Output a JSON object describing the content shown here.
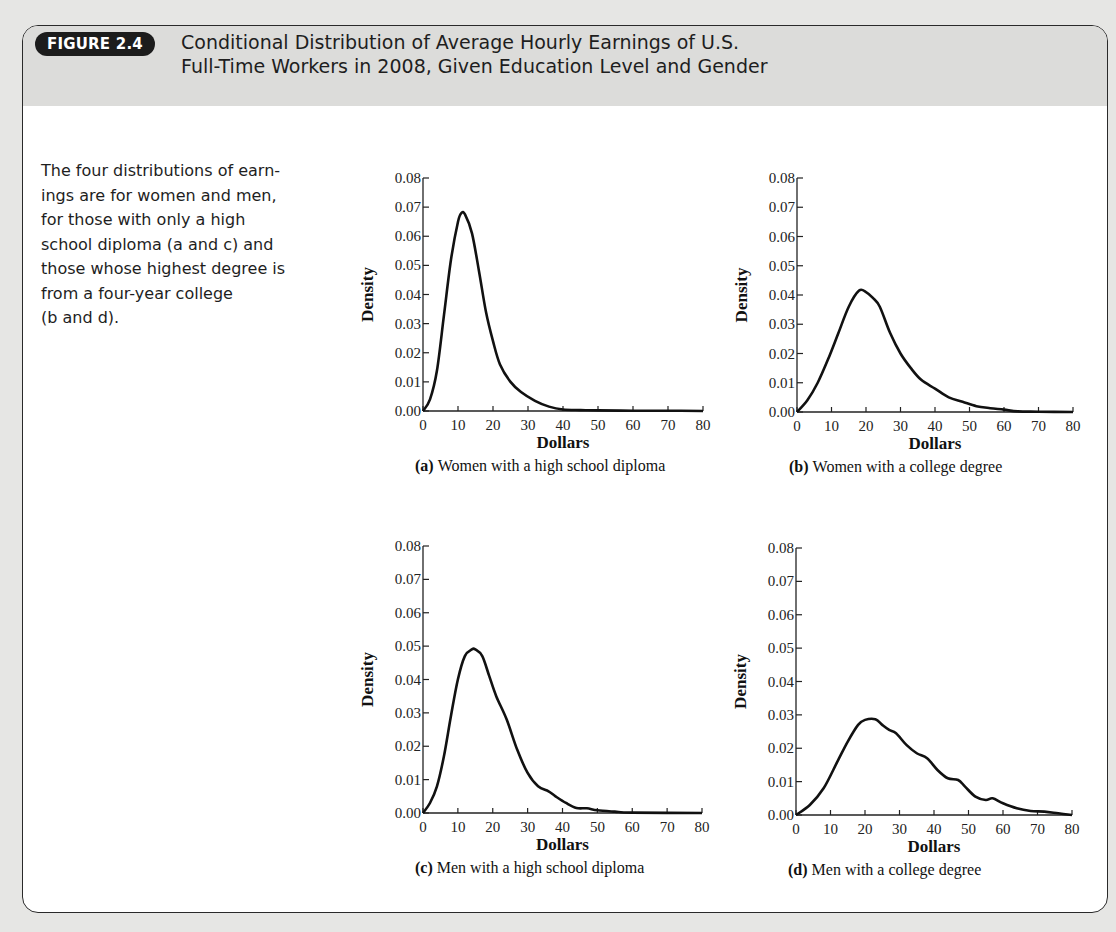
{
  "figure": {
    "badge": "FIGURE 2.4",
    "title_line1": "Conditional Distribution of Average Hourly Earnings of U.S.",
    "title_line2": "Full-Time Workers in 2008, Given Education Level and Gender",
    "description_lines": [
      "The four distributions of earn-",
      "ings are for women and men,",
      "for those with only a high",
      "school diploma (a and c) and",
      "those whose highest degree is",
      "from a four-year college",
      "(b and d)."
    ]
  },
  "chart_data": [
    {
      "type": "line",
      "panel": "a",
      "caption_letter": "(a)",
      "caption": "Women with a high school diploma",
      "title": "",
      "xlabel": "Dollars",
      "ylabel": "Density",
      "xlim": [
        0,
        80
      ],
      "ylim": [
        0,
        0.08
      ],
      "xticks": [
        "0",
        "10",
        "20",
        "30",
        "40",
        "50",
        "60",
        "70",
        "80"
      ],
      "yticks": [
        "0.00",
        "0.01",
        "0.02",
        "0.03",
        "0.04",
        "0.05",
        "0.06",
        "0.07",
        "0.08"
      ],
      "grid": false,
      "x": [
        0,
        2,
        4,
        6,
        8,
        10,
        11,
        12,
        14,
        16,
        18,
        20,
        22,
        25,
        28,
        32,
        36,
        40,
        45,
        50,
        60,
        70,
        80
      ],
      "y": [
        0.0,
        0.004,
        0.014,
        0.033,
        0.052,
        0.065,
        0.068,
        0.0675,
        0.061,
        0.048,
        0.034,
        0.024,
        0.016,
        0.01,
        0.0065,
        0.0035,
        0.0015,
        0.0005,
        0.0003,
        0.0002,
        0.0001,
        0.0001,
        0.0
      ]
    },
    {
      "type": "line",
      "panel": "b",
      "caption_letter": "(b)",
      "caption": "Women with a college degree",
      "title": "",
      "xlabel": "Dollars",
      "ylabel": "Density",
      "xlim": [
        0,
        80
      ],
      "ylim": [
        0,
        0.08
      ],
      "xticks": [
        "0",
        "10",
        "20",
        "30",
        "40",
        "50",
        "60",
        "70",
        "80"
      ],
      "yticks": [
        "0.00",
        "0.01",
        "0.02",
        "0.03",
        "0.04",
        "0.05",
        "0.06",
        "0.07",
        "0.08"
      ],
      "grid": false,
      "x": [
        0,
        3,
        6,
        9,
        12,
        15,
        18,
        20,
        22,
        24,
        27,
        30,
        33,
        36,
        40,
        44,
        48,
        52,
        56,
        60,
        64,
        70,
        80
      ],
      "y": [
        0.0,
        0.004,
        0.01,
        0.018,
        0.027,
        0.036,
        0.0415,
        0.041,
        0.039,
        0.036,
        0.027,
        0.02,
        0.015,
        0.011,
        0.008,
        0.005,
        0.0035,
        0.002,
        0.0013,
        0.0008,
        0.0002,
        0.0001,
        0.0
      ]
    },
    {
      "type": "line",
      "panel": "c",
      "caption_letter": "(c)",
      "caption": "Men with a high school diploma",
      "title": "",
      "xlabel": "Dollars",
      "ylabel": "Density",
      "xlim": [
        0,
        80
      ],
      "ylim": [
        0,
        0.08
      ],
      "xticks": [
        "0",
        "10",
        "20",
        "30",
        "40",
        "50",
        "60",
        "70",
        "80"
      ],
      "yticks": [
        "0.00",
        "0.01",
        "0.02",
        "0.03",
        "0.04",
        "0.05",
        "0.06",
        "0.07",
        "0.08"
      ],
      "grid": false,
      "x": [
        0,
        2,
        4,
        6,
        8,
        10,
        12,
        14,
        15,
        17,
        19,
        21,
        24,
        27,
        30,
        33,
        36,
        38,
        41,
        44,
        47,
        50,
        55,
        60,
        80
      ],
      "y": [
        0.0,
        0.003,
        0.008,
        0.017,
        0.029,
        0.04,
        0.047,
        0.049,
        0.049,
        0.047,
        0.041,
        0.035,
        0.028,
        0.019,
        0.012,
        0.008,
        0.0065,
        0.005,
        0.003,
        0.0015,
        0.0014,
        0.0008,
        0.0004,
        0.0001,
        0.0
      ]
    },
    {
      "type": "line",
      "panel": "d",
      "caption_letter": "(d)",
      "caption": "Men with a college degree",
      "title": "",
      "xlabel": "Dollars",
      "ylabel": "Density",
      "xlim": [
        0,
        80
      ],
      "ylim": [
        0,
        0.08
      ],
      "xticks": [
        "0",
        "10",
        "20",
        "30",
        "40",
        "50",
        "60",
        "70",
        "80"
      ],
      "yticks": [
        "0.00",
        "0.01",
        "0.02",
        "0.03",
        "0.04",
        "0.05",
        "0.06",
        "0.07",
        "0.08"
      ],
      "grid": false,
      "x": [
        0,
        4,
        8,
        12,
        15,
        18,
        20,
        23,
        25,
        27,
        29,
        32,
        35,
        38,
        41,
        44,
        47,
        49,
        52,
        55,
        57,
        60,
        64,
        68,
        72,
        76,
        80
      ],
      "y": [
        0.0,
        0.003,
        0.008,
        0.016,
        0.022,
        0.027,
        0.0285,
        0.0287,
        0.027,
        0.0255,
        0.0245,
        0.021,
        0.0185,
        0.017,
        0.0135,
        0.011,
        0.0105,
        0.0085,
        0.0055,
        0.0045,
        0.005,
        0.0035,
        0.002,
        0.0012,
        0.001,
        0.0005,
        0.0
      ]
    }
  ]
}
